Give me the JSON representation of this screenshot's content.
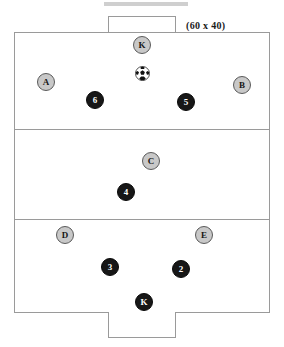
{
  "diagram": {
    "field_size_label": "(60 x 40)",
    "field": {
      "width_units": 60,
      "height_units": 40,
      "thirds": 3,
      "line_color": "#9a9a9a",
      "background_color": "#ffffff"
    },
    "goals": [
      {
        "name": "goal-top",
        "position": "top"
      },
      {
        "name": "goal-bottom",
        "position": "bottom"
      }
    ],
    "teams": {
      "light": {
        "name": "lettered-team",
        "token_fill": "#c8c8c8",
        "token_border": "#5a5a5a",
        "token_text_color": "#151515"
      },
      "dark": {
        "name": "numbered-team",
        "token_fill": "#171717",
        "token_border": "#0a0a0a",
        "token_text_color": "#ffffff"
      }
    },
    "ball": {
      "name": "soccer-ball",
      "x": 142,
      "y": 73
    },
    "players": [
      {
        "label": "K",
        "team": "light",
        "x": 142,
        "y": 45,
        "third": "top",
        "role": "goalkeeper"
      },
      {
        "label": "A",
        "team": "light",
        "x": 46,
        "y": 82,
        "third": "top",
        "role": "field"
      },
      {
        "label": "B",
        "team": "light",
        "x": 242,
        "y": 85,
        "third": "top",
        "role": "field"
      },
      {
        "label": "6",
        "team": "dark",
        "x": 95,
        "y": 100,
        "third": "top",
        "role": "field"
      },
      {
        "label": "5",
        "team": "dark",
        "x": 186,
        "y": 102,
        "third": "top",
        "role": "field"
      },
      {
        "label": "C",
        "team": "light",
        "x": 151,
        "y": 161,
        "third": "middle",
        "role": "field"
      },
      {
        "label": "4",
        "team": "dark",
        "x": 126,
        "y": 192,
        "third": "middle",
        "role": "field"
      },
      {
        "label": "D",
        "team": "light",
        "x": 65,
        "y": 235,
        "third": "bottom",
        "role": "field"
      },
      {
        "label": "E",
        "team": "light",
        "x": 204,
        "y": 235,
        "third": "bottom",
        "role": "field"
      },
      {
        "label": "3",
        "team": "dark",
        "x": 110,
        "y": 267,
        "third": "bottom",
        "role": "field"
      },
      {
        "label": "2",
        "team": "dark",
        "x": 181,
        "y": 269,
        "third": "bottom",
        "role": "field"
      },
      {
        "label": "K",
        "team": "dark",
        "x": 144,
        "y": 302,
        "third": "bottom",
        "role": "goalkeeper"
      }
    ]
  }
}
